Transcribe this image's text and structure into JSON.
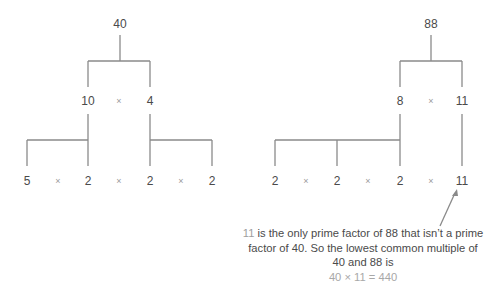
{
  "left_tree": {
    "root": "40",
    "level1": [
      "10",
      "4"
    ],
    "level2": [
      "5",
      "2",
      "2",
      "2"
    ],
    "operator": "×"
  },
  "right_tree": {
    "root": "88",
    "level1": [
      "8",
      "11"
    ],
    "level2": [
      "2",
      "2",
      "2",
      "11"
    ],
    "operator": "×"
  },
  "annotation": {
    "highlight": "11",
    "text_line1": " is the only prime factor of 88 that isn’t a prime",
    "text_line2": "factor of 40. So the lowest common multiple of",
    "text_line3": "40 and 88 is",
    "equation": "40 × 11 = 440"
  },
  "colors": {
    "line": "#8a8a8a",
    "text": "#4a4a4a",
    "operator": "#9a9a9a",
    "highlight": "#9e9e9e"
  }
}
